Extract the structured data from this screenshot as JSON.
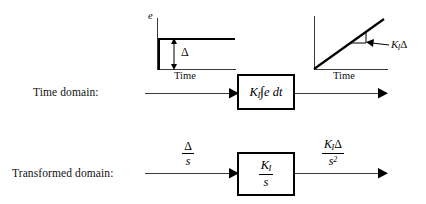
{
  "figure": {
    "type": "block-diagram",
    "background_color": "#ffffff",
    "line_color": "#3a3a3a",
    "block_border_color": "#000000"
  },
  "rows": {
    "time_domain": {
      "label": "Time domain:",
      "block_text": "K_I ∫e dt",
      "block_parts": {
        "gain": "K",
        "gain_subscript": "I",
        "integral": "∫",
        "integrand": "e",
        "differential": "dt"
      },
      "input_plot": {
        "y_axis_label": "e",
        "x_axis_label": "Time",
        "signal": "step",
        "amplitude_label": "Δ"
      },
      "output_plot": {
        "x_axis_label": "Time",
        "signal": "ramp",
        "slope_label_gain": "K",
        "slope_label_subscript": "I",
        "slope_label_delta": "Δ"
      }
    },
    "transformed_domain": {
      "label": "Transformed domain:",
      "input_signal": {
        "numerator": "Δ",
        "denominator": "s"
      },
      "block_transfer_function": {
        "numerator_gain": "K",
        "numerator_subscript": "I",
        "denominator": "s"
      },
      "output_signal": {
        "numerator_gain": "K",
        "numerator_subscript": "I",
        "numerator_delta": "Δ",
        "denominator": "s",
        "denominator_exponent": "2"
      }
    }
  }
}
